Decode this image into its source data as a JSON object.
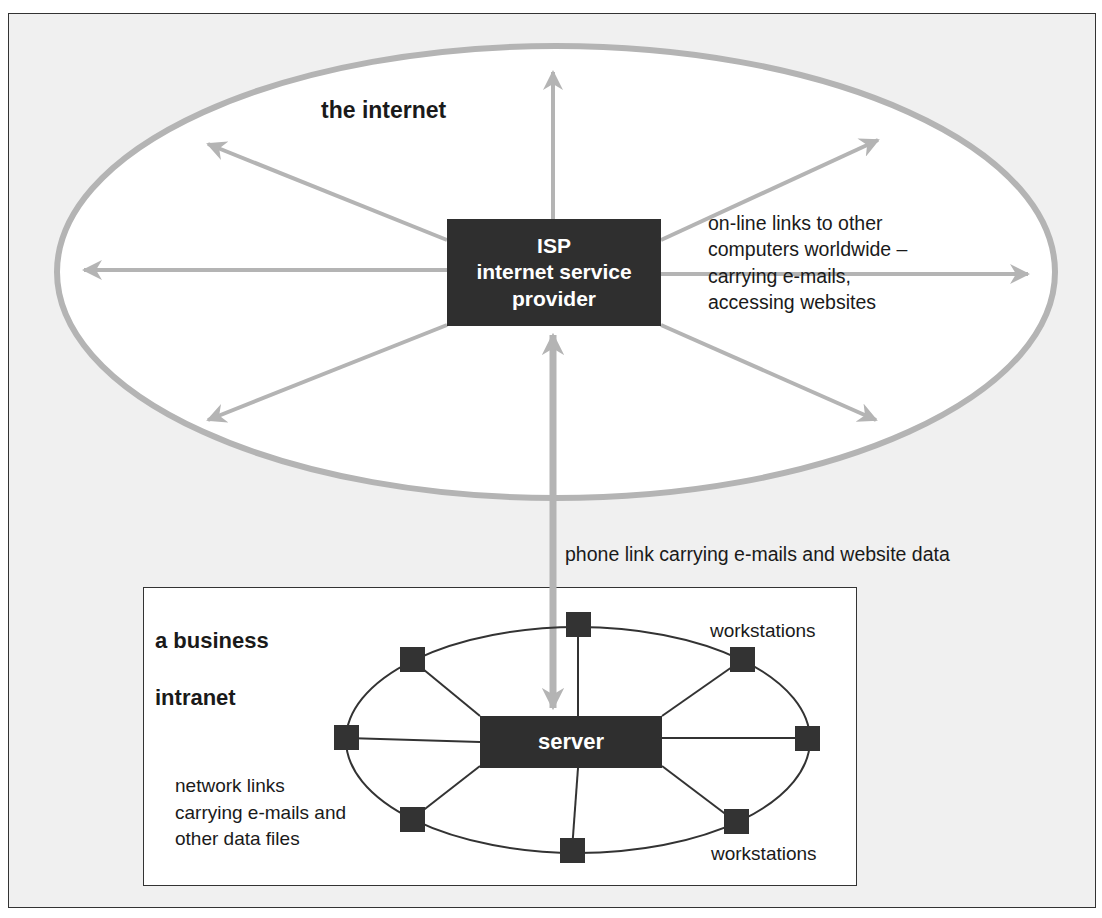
{
  "figure": {
    "background_color": "#f0f0f0",
    "arrow_color": "#b4b4b4",
    "box_color": "#2f2f2f",
    "node_color": "#333333"
  },
  "internet": {
    "title": "the internet",
    "isp_box": {
      "line1": "ISP",
      "line2": "internet service",
      "line3": "provider"
    },
    "links_caption": "on-line links to other\ncomputers worldwide –\ncarrying e-mails,\naccessing websites"
  },
  "phone_link": {
    "caption": "phone link carrying e-mails and website data"
  },
  "intranet": {
    "title_line1": "a business",
    "title_line2": "intranet",
    "server_label": "server",
    "workstations_top_label": "workstations",
    "workstations_bottom_label": "workstations",
    "network_caption": "network links\ncarrying e-mails and\nother data files",
    "workstation_count": 8
  }
}
